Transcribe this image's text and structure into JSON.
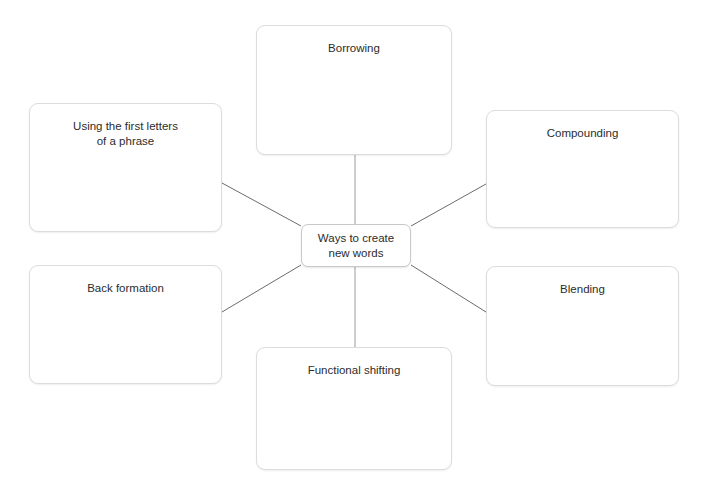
{
  "diagram": {
    "type": "mind-map",
    "center": {
      "label": "Ways to create\nnew words"
    },
    "nodes": [
      {
        "id": "top",
        "label": "Borrowing"
      },
      {
        "id": "top-left",
        "label": "Using the first letters\nof a phrase"
      },
      {
        "id": "top-right",
        "label": "Compounding"
      },
      {
        "id": "bottom-left",
        "label": "Back formation"
      },
      {
        "id": "bottom-right",
        "label": "Blending"
      },
      {
        "id": "bottom",
        "label": "Functional shifting"
      }
    ],
    "colors": {
      "background": "#ffffff",
      "node_fill": "#ffffff",
      "node_border": "#dcdcdc",
      "center_border": "#c9c9c9",
      "connector": "#6b6b6b",
      "text": "#2c2c2c"
    }
  }
}
